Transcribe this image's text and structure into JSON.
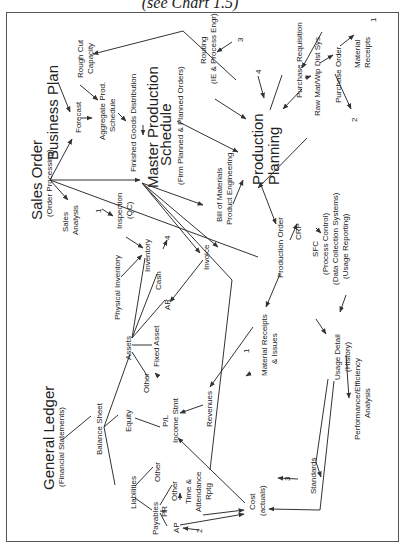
{
  "caption": "(see Chart 1.5)",
  "diagram": {
    "orientation": "rotated-90-ccw",
    "nodes": {
      "business_plan": "Business Plan",
      "forecast": "Forecast",
      "rough_cut": [
        "Rough Cut",
        "Capacity"
      ],
      "aggregate": [
        "Aggregate Prod.",
        "Schedule"
      ],
      "fg_distribution": "Finished Goods Distribution",
      "mps_title": [
        "Master Production",
        "Schedule"
      ],
      "mps_sub": "(Firm Planned & Planned Orders)",
      "routing": [
        "Routing",
        "(IE & Process Engr)"
      ],
      "routing_ref": "3",
      "pp_ref4": "4",
      "purchase_req": "Purchase Requisition",
      "raw_mat": "Raw Mat/Wip Dist Sys",
      "purchase_order": "Purchase Order",
      "material_receipts_top": [
        "Material",
        "Receipts"
      ],
      "mr_ref1": "1",
      "po_ref2": "2",
      "production_planning": [
        "Production",
        "Planning"
      ],
      "sales_order": "Sales Order",
      "sales_order_sub": "(Order Processing)",
      "sales_analysis": [
        "Sales",
        "Analysis"
      ],
      "inspection": [
        "Inspection",
        "(QC)"
      ],
      "inspection_ref": "1",
      "bom": [
        "Bill of Materials",
        "Product Engineering"
      ],
      "production_order": "Production Order",
      "crp": "CRP",
      "sfc": [
        "SFC",
        "(Process Control)",
        "(Data Collection Systems)",
        "(Usage Reporting)"
      ],
      "physical_inventory": "Physical Inventory",
      "inventory": "Inventory",
      "inventory_ref": "4",
      "cash": "Cash",
      "ar": "AR",
      "invoice": "Invoice",
      "assets": "Assets",
      "fixed_asset": "Fixed Asset",
      "other_assets": "Other",
      "material_receipts_issues": [
        "Material Receipts",
        "& Issues"
      ],
      "mri_ref": "1",
      "usage_detail": [
        "Usage Detail",
        "(History)"
      ],
      "performance": [
        "Performance/Efficiency",
        "Analysis"
      ],
      "general_ledger": "General Ledger",
      "general_ledger_sub": "(Financial Statements)",
      "balance_sheet": "Balance Sheet",
      "equity": "Equity",
      "pl": [
        "P/L",
        "Income Stmt"
      ],
      "revenues": "Revenues",
      "liabilities": "Liabilities",
      "other_liab": "Other",
      "payables": "Payables",
      "pr": "PR",
      "other_pay": "Other",
      "ap": "AP",
      "ap_ref": "2",
      "time_attendance": [
        "Time &",
        "Attendance",
        "Rptg"
      ],
      "standards": "Standards",
      "standards_ref": "3",
      "cost": [
        "Cost",
        "(actuals)"
      ]
    }
  }
}
